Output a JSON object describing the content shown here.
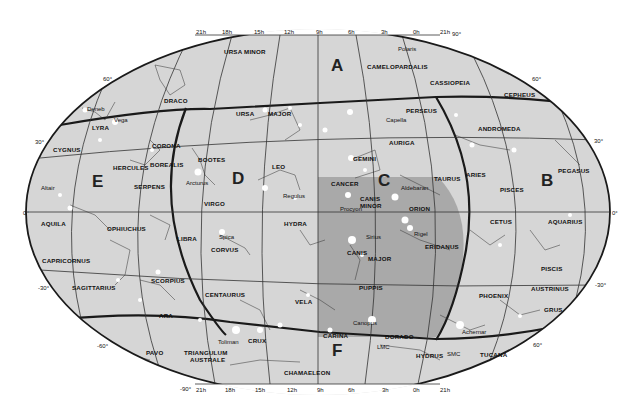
{
  "map": {
    "colors": {
      "sky": "#d6d6d6",
      "shaded_region": "#a9a9a9",
      "grid_line": "#333333",
      "boundary_line": "#1a1a1a",
      "star": "#ffffff",
      "background": "#ffffff"
    },
    "ra_ticks_top": [
      "21h",
      "18h",
      "15h",
      "12h",
      "9h",
      "6h",
      "3h",
      "0h",
      "21h"
    ],
    "ra_ticks_bottom": [
      "21h",
      "18h",
      "15h",
      "12h",
      "9h",
      "6h",
      "3h",
      "0h",
      "21h"
    ],
    "dec_ticks": {
      "top_pole": "90°",
      "bottom_pole": "-90°",
      "left": [
        "60°",
        "30°",
        "0°",
        "-30°",
        "-60°"
      ],
      "right": [
        "60°",
        "30°",
        "0°",
        "-30°",
        "60°"
      ]
    },
    "zones": [
      "A",
      "B",
      "C",
      "D",
      "E",
      "F"
    ],
    "constellations": [
      "URSA MINOR",
      "CAMELOPARDALIS",
      "CASSIOPEIA",
      "CEPHEUS",
      "DRACO",
      "PERSEUS",
      "URSA",
      "MAJOR",
      "AURIGA",
      "LYRA",
      "CYGNUS",
      "CORONA",
      "BOREALIS",
      "HERCULES",
      "BOOTES",
      "LEO",
      "GEMINI",
      "TAURUS",
      "ANDROMEDA",
      "ARIES",
      "PISCES",
      "PEGASUS",
      "SERPENS",
      "VIRGO",
      "CANCER",
      "CANIS",
      "MINOR",
      "ORION",
      "AQUILA",
      "OPHIUCHUS",
      "LIBRA",
      "CORVUS",
      "HYDRA",
      "ERIDANUS",
      "CETUS",
      "AQUARIUS",
      "CAPRICORNUS",
      "SAGITTARIUS",
      "SCORPIUS",
      "CENTAURUS",
      "CANIS MAJOR",
      "PUPPIS",
      "PISCIS",
      "AUSTRINUS",
      "PHOENIX",
      "GRUS",
      "VELA",
      "ARA",
      "PAVO",
      "TRIANGULUM",
      "AUSTRALE",
      "CRUX",
      "CARINA",
      "DORADO",
      "HYDRUS",
      "TUCANA",
      "CHAMAELEON"
    ],
    "named_stars": [
      "Polaris",
      "Deneb",
      "Vega",
      "Capella",
      "Arcturus",
      "Regulus",
      "Aldebaran",
      "Altair",
      "Procyon",
      "Spica",
      "Rigel",
      "Sirius",
      "Canopus",
      "Achernar",
      "Toliman"
    ],
    "other_objects": [
      "LMC",
      "SMC"
    ],
    "labels": {
      "ursa_minor": "URSA MINOR",
      "camelopardalis": "CAMELOPARDALIS",
      "cassiopeia": "CASSIOPEIA",
      "cepheus": "CEPHEUS",
      "draco": "DRACO",
      "perseus": "PERSEUS",
      "ursa": "URSA",
      "major": "MAJOR",
      "auriga": "AURIGA",
      "lyra": "LYRA",
      "cygnus": "CYGNUS",
      "corona": "CORONA",
      "borealis": "BOREALIS",
      "hercules": "HERCULES",
      "bootes": "BOOTES",
      "leo": "LEO",
      "gemini": "GEMINI",
      "taurus": "TAURUS",
      "andromeda": "ANDROMEDA",
      "aries": "ARIES",
      "pisces": "PISCES",
      "pegasus": "PEGASUS",
      "serpens": "SERPENS",
      "virgo": "VIRGO",
      "cancer": "CANCER",
      "canis_minor_1": "CANIS",
      "canis_minor_2": "MINOR",
      "orion": "ORION",
      "aquila": "AQUILA",
      "ophiuchus": "OPHIUCHUS",
      "libra": "LIBRA",
      "corvus": "CORVUS",
      "hydra": "HYDRA",
      "eridanus": "ERIDANUS",
      "cetus": "CETUS",
      "aquarius": "AQUARIUS",
      "capricornus": "CAPRICORNUS",
      "sagittarius": "SAGITTARIUS",
      "scorpius": "SCORPIUS",
      "centaurus": "CENTAURUS",
      "canis_major_1": "CANIS",
      "canis_major_2": "MAJOR",
      "puppis": "PUPPIS",
      "piscis": "PISCIS",
      "austrinus": "AUSTRINUS",
      "phoenix": "PHOENIX",
      "grus": "GRUS",
      "vela": "VELA",
      "ara": "ARA",
      "pavo": "PAVO",
      "triangulum": "TRIANGULUM",
      "australe": "AUSTRALE",
      "crux": "CRUX",
      "carina": "CARINA",
      "dorado": "DORADO",
      "hydrus": "HYDRUS",
      "tucana": "TUCANA",
      "chamaeleon": "CHAMAELEON"
    },
    "stars": {
      "polaris": "Polaris",
      "deneb": "Deneb",
      "vega": "Vega",
      "capella": "Capella",
      "arcturus": "Arcturus",
      "regulus": "Regulus",
      "aldebaran": "Aldebaran",
      "altair": "Altair",
      "procyon": "Procyon",
      "spica": "Spica",
      "rigel": "Rigel",
      "sirius": "Sirius",
      "canopus": "Canopus",
      "achernar": "Achernar",
      "toliman": "Toliman",
      "lmc": "LMC",
      "smc": "SMC"
    }
  }
}
